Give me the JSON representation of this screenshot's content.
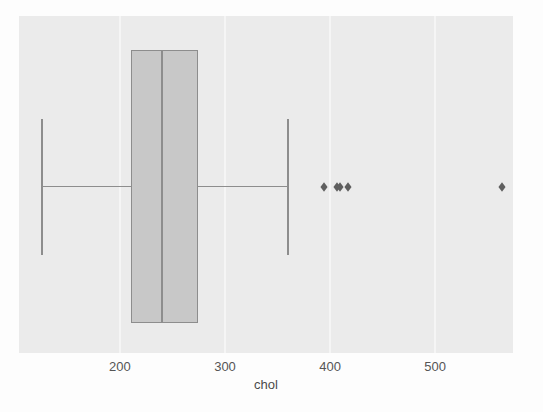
{
  "figure": {
    "page_background": "#fdfdfd"
  },
  "chart_data": {
    "type": "box",
    "orientation": "horizontal",
    "title": "",
    "xlabel": "chol",
    "ylabel": "",
    "x_ticks": [
      200,
      300,
      400,
      500
    ],
    "x_tick_labels": [
      "200",
      "300",
      "400",
      "500"
    ],
    "xlim": [
      104,
      574
    ],
    "grid": "vertical gridlines at x ticks",
    "legend": "none",
    "series": [
      {
        "name": "chol",
        "whisker_low": 126,
        "q1": 211,
        "median": 240,
        "q3": 274,
        "whisker_high": 360,
        "outliers": [
          394,
          407,
          409,
          417,
          564
        ]
      }
    ],
    "colors": {
      "page_background": "#fdfdfd",
      "plot_background": "#ebebeb",
      "gridline": "#f5f5f5",
      "box_fill": "#c8c8c8",
      "box_border": "#8d8d8d",
      "whisker": "#8d8d8d",
      "outlier": "#5f5f5f",
      "tick_text": "#555555",
      "axis_label_text": "#4a4a4a"
    }
  }
}
